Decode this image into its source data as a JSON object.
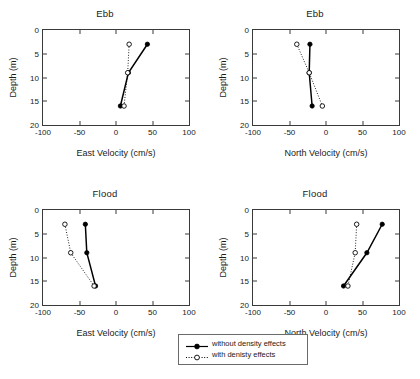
{
  "figure": {
    "axis_color": "#3a3a3a",
    "series_color": "#000000"
  },
  "legend": {
    "entries": [
      {
        "label": "without density effects",
        "style": "solid-filled-circle"
      },
      {
        "label": "with denisty effects",
        "style": "dotted-open-circle"
      }
    ]
  },
  "chart_data": [
    {
      "type": "line",
      "title": "Ebb",
      "xlabel": "East Velocity (cm/s)",
      "ylabel": "Depth (m)",
      "xlim": [
        -100,
        100
      ],
      "ylim": [
        0,
        20
      ],
      "y_inverted": true,
      "xticks": [
        -100,
        -50,
        0,
        50,
        100
      ],
      "yticks": [
        0,
        5,
        10,
        15,
        20
      ],
      "grid": false,
      "legend_position": "below-figure",
      "series": [
        {
          "name": "without density effects",
          "depths": [
            3,
            9,
            16
          ],
          "values": [
            43,
            17,
            6
          ]
        },
        {
          "name": "with denisty effects",
          "depths": [
            3,
            9,
            16
          ],
          "values": [
            18,
            16,
            11
          ]
        }
      ]
    },
    {
      "type": "line",
      "title": "Ebb",
      "xlabel": "North Velocity (cm/s)",
      "ylabel": "Depth (m)",
      "xlim": [
        -100,
        100
      ],
      "ylim": [
        0,
        20
      ],
      "y_inverted": true,
      "xticks": [
        -100,
        -50,
        0,
        50,
        100
      ],
      "yticks": [
        0,
        5,
        10,
        15,
        20
      ],
      "grid": false,
      "legend_position": "below-figure",
      "series": [
        {
          "name": "without density effects",
          "depths": [
            3,
            9,
            16
          ],
          "values": [
            -22,
            -23,
            -19
          ]
        },
        {
          "name": "with denisty effects",
          "depths": [
            3,
            9,
            16
          ],
          "values": [
            -40,
            -23,
            -5
          ]
        }
      ]
    },
    {
      "type": "line",
      "title": "Flood",
      "xlabel": "East Velocity (cm/s)",
      "ylabel": "Depth (m)",
      "xlim": [
        -100,
        100
      ],
      "ylim": [
        0,
        20
      ],
      "y_inverted": true,
      "xticks": [
        -100,
        -50,
        0,
        50,
        100
      ],
      "yticks": [
        0,
        5,
        10,
        15,
        20
      ],
      "grid": false,
      "legend_position": "below-figure",
      "series": [
        {
          "name": "without density effects",
          "depths": [
            3,
            9,
            16
          ],
          "values": [
            -42,
            -40,
            -28
          ]
        },
        {
          "name": "with denisty effects",
          "depths": [
            3,
            9,
            16
          ],
          "values": [
            -70,
            -62,
            -30
          ]
        }
      ]
    },
    {
      "type": "line",
      "title": "Flood",
      "xlabel": "North Velocity (cm/s)",
      "ylabel": "Depth (m)",
      "xlim": [
        -100,
        100
      ],
      "ylim": [
        0,
        20
      ],
      "y_inverted": true,
      "xticks": [
        -100,
        -50,
        0,
        50,
        100
      ],
      "yticks": [
        0,
        5,
        10,
        15,
        20
      ],
      "grid": false,
      "legend_position": "below-figure",
      "series": [
        {
          "name": "without density effects",
          "depths": [
            3,
            9,
            16
          ],
          "values": [
            77,
            56,
            24
          ]
        },
        {
          "name": "with denisty effects",
          "depths": [
            3,
            9,
            16
          ],
          "values": [
            42,
            40,
            30
          ]
        }
      ]
    }
  ]
}
